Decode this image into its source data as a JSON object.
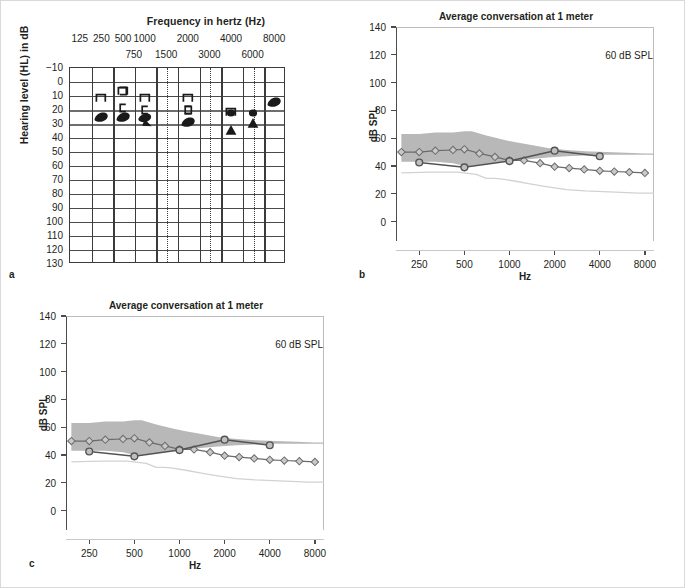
{
  "figure": {
    "panels": [
      {
        "letter": "a",
        "kind": "audiogram"
      },
      {
        "letter": "b",
        "kind": "spl"
      },
      {
        "letter": "c",
        "kind": "spl"
      }
    ]
  },
  "audiogram": {
    "x_axis_title": "Frequency in hertz (Hz)",
    "y_axis_title": "Hearing level (HL) in dB",
    "octave_ticks": [
      "125",
      "250",
      "500",
      "1000",
      "2000",
      "4000",
      "8000"
    ],
    "interoctave_ticks": [
      "750",
      "1500",
      "3000",
      "6000"
    ],
    "y_ticks": [
      "−10",
      "0",
      "10",
      "20",
      "30",
      "40",
      "50",
      "60",
      "70",
      "80",
      "90",
      "100",
      "110",
      "120",
      "130"
    ],
    "y_min": -10,
    "y_max": 130,
    "x_positions_hz": [
      125,
      250,
      500,
      750,
      1000,
      1500,
      2000,
      3000,
      4000,
      6000,
      8000
    ],
    "symbols": [
      {
        "name": "masked-bone-right-250",
        "glyph": "bracket-right",
        "hz": 250,
        "db": 12
      },
      {
        "name": "masked-bone-left-500",
        "glyph": "bracket-left",
        "hz": 500,
        "db": 19
      },
      {
        "name": "masked-bone-right-500",
        "glyph": "bracket-right",
        "hz": 500,
        "db": 7
      },
      {
        "name": "masked-bone-left-500b",
        "glyph": "bracket-left2",
        "hz": 500,
        "db": 7
      },
      {
        "name": "masked-bone-right-1000",
        "glyph": "bracket-right",
        "hz": 1000,
        "db": 12
      },
      {
        "name": "masked-bone-left-1000",
        "glyph": "bracket-left",
        "hz": 1000,
        "db": 21
      },
      {
        "name": "masked-bone-right-2000",
        "glyph": "bracket-right",
        "hz": 2000,
        "db": 12
      },
      {
        "name": "masked-bone-left-2000",
        "glyph": "bracket-left",
        "hz": 2000,
        "db": 21
      },
      {
        "name": "masked-bone-right-2000b",
        "glyph": "bracket-left2",
        "hz": 2000,
        "db": 21
      },
      {
        "name": "masked-bone-right-4000",
        "glyph": "bracket-right",
        "hz": 4000,
        "db": 22
      },
      {
        "name": "air-left-250",
        "glyph": "blob",
        "hz": 250,
        "db": 26
      },
      {
        "name": "air-left-500",
        "glyph": "blob",
        "hz": 500,
        "db": 26
      },
      {
        "name": "air-left-1000",
        "glyph": "blob-tri",
        "hz": 1000,
        "db": 28
      },
      {
        "name": "air-left-2000",
        "glyph": "blob",
        "hz": 2000,
        "db": 29
      },
      {
        "name": "air-left-4000",
        "glyph": "dot",
        "hz": 4000,
        "db": 23
      },
      {
        "name": "air-left-4000b",
        "glyph": "triangle",
        "hz": 4000,
        "db": 35
      },
      {
        "name": "air-left-6000",
        "glyph": "dot",
        "hz": 6000,
        "db": 23
      },
      {
        "name": "air-left-6000b",
        "glyph": "triangle",
        "hz": 6000,
        "db": 30
      },
      {
        "name": "air-left-8000",
        "glyph": "blob",
        "hz": 8000,
        "db": 15
      }
    ]
  },
  "spl_chart": {
    "title": "Average conversation at 1 meter",
    "note": "60 dB SPL",
    "y_title": "dB SPL",
    "x_title": "Hz",
    "y_ticks": [
      0,
      20,
      40,
      60,
      80,
      100,
      120,
      140
    ],
    "x_ticks": [
      250,
      500,
      1000,
      2000,
      4000,
      8000
    ],
    "y_min": -14,
    "y_max": 140,
    "x_min_hz": 175,
    "x_max_hz": 9200,
    "colors": {
      "banana_fill": "#b8b8b8",
      "aided_line": "#545454",
      "unaided_line": "#6b6b6b",
      "threshold_line": "#d2d2d2"
    }
  },
  "chart_data": [
    {
      "type": "line",
      "panel": "b",
      "title": "Average conversation at 1 meter",
      "xlabel": "Hz",
      "ylabel": "dB SPL",
      "annotation": "60 dB SPL",
      "xscale": "log",
      "xlim": [
        175,
        9200
      ],
      "ylim": [
        -14,
        140
      ],
      "yticks": [
        0,
        20,
        40,
        60,
        80,
        100,
        120,
        140
      ],
      "xticks": [
        250,
        500,
        1000,
        2000,
        4000,
        8000
      ],
      "grid": false,
      "legend": "none",
      "series": [
        {
          "name": "speech-banana-upper",
          "kind": "band-upper",
          "x": [
            190,
            250,
            320,
            420,
            500,
            560,
            700,
            900,
            1100,
            1400,
            1800,
            2400,
            3200,
            4400,
            6000,
            8000,
            9200
          ],
          "y": [
            63,
            63,
            64,
            64,
            65,
            65,
            62,
            59,
            57,
            55,
            53,
            51.5,
            50.5,
            50,
            49.5,
            49,
            49
          ]
        },
        {
          "name": "speech-banana-lower",
          "kind": "band-lower",
          "x": [
            190,
            250,
            320,
            420,
            500,
            560,
            700,
            900,
            1100,
            1400,
            1800,
            2400,
            3200,
            4400,
            6000,
            8000,
            9200
          ],
          "y": [
            43,
            43,
            43,
            42,
            40,
            40,
            41,
            43,
            44,
            45,
            46,
            47,
            47.5,
            48,
            48,
            48,
            48
          ]
        },
        {
          "name": "aided-response",
          "kind": "line-circle",
          "marker": "circle",
          "x": [
            250,
            500,
            1000,
            2000,
            4000
          ],
          "y": [
            42.5,
            39,
            43.5,
            51,
            47
          ]
        },
        {
          "name": "unaided-response",
          "kind": "line-diamond",
          "marker": "diamond",
          "x": [
            190,
            250,
            320,
            420,
            500,
            630,
            800,
            1000,
            1250,
            1600,
            2000,
            2500,
            3150,
            4000,
            5000,
            6300,
            8000
          ],
          "y": [
            50,
            50,
            51,
            51.5,
            52,
            49,
            46.5,
            44,
            44,
            42,
            39.5,
            38.5,
            37.5,
            36.5,
            36,
            35.5,
            35
          ]
        },
        {
          "name": "hearing-threshold",
          "kind": "line-thin",
          "x": [
            190,
            300,
            450,
            600,
            700,
            800,
            900,
            1100,
            1400,
            1800,
            2400,
            3200,
            4200,
            5600,
            7200,
            9200
          ],
          "y": [
            35,
            35.5,
            35.5,
            34,
            31,
            31,
            30.5,
            29,
            27,
            25,
            23,
            22,
            21.5,
            21,
            20.5,
            20.5
          ]
        }
      ]
    },
    {
      "type": "line",
      "panel": "c",
      "title": "Average conversation at 1 meter",
      "xlabel": "Hz",
      "ylabel": "dB SPL",
      "annotation": "60 dB SPL",
      "xscale": "log",
      "xlim": [
        175,
        9200
      ],
      "ylim": [
        -14,
        140
      ],
      "yticks": [
        0,
        20,
        40,
        60,
        80,
        100,
        120,
        140
      ],
      "xticks": [
        250,
        500,
        1000,
        2000,
        4000,
        8000
      ],
      "grid": false,
      "legend": "none",
      "series": [
        {
          "name": "speech-banana-upper",
          "kind": "band-upper",
          "x": [
            190,
            250,
            320,
            420,
            500,
            560,
            700,
            900,
            1100,
            1400,
            1800,
            2400,
            3200,
            4400,
            6000,
            8000,
            9200
          ],
          "y": [
            63,
            63,
            64,
            64,
            65,
            65,
            62,
            59,
            57,
            55,
            53,
            51.5,
            50.5,
            50,
            49.5,
            49,
            49
          ]
        },
        {
          "name": "speech-banana-lower",
          "kind": "band-lower",
          "x": [
            190,
            250,
            320,
            420,
            500,
            560,
            700,
            900,
            1100,
            1400,
            1800,
            2400,
            3200,
            4400,
            6000,
            8000,
            9200
          ],
          "y": [
            43,
            43,
            43,
            42,
            40,
            40,
            41,
            43,
            44,
            45,
            46,
            47,
            47.5,
            48,
            48,
            48,
            48
          ]
        },
        {
          "name": "aided-response",
          "kind": "line-circle",
          "marker": "circle",
          "x": [
            250,
            500,
            1000,
            2000,
            4000
          ],
          "y": [
            42.5,
            39,
            43.5,
            51,
            47
          ]
        },
        {
          "name": "unaided-response",
          "kind": "line-diamond",
          "marker": "diamond",
          "x": [
            190,
            250,
            320,
            420,
            500,
            630,
            800,
            1000,
            1250,
            1600,
            2000,
            2500,
            3150,
            4000,
            5000,
            6300,
            8000
          ],
          "y": [
            50,
            50,
            51,
            51.5,
            52,
            49,
            46.5,
            44,
            44,
            42,
            39.5,
            38.5,
            37.5,
            36.5,
            36,
            35.5,
            35
          ]
        },
        {
          "name": "hearing-threshold",
          "kind": "line-thin",
          "x": [
            190,
            300,
            450,
            600,
            700,
            800,
            900,
            1100,
            1400,
            1800,
            2400,
            3200,
            4200,
            5600,
            7200,
            9200
          ],
          "y": [
            35,
            35.5,
            35.5,
            34,
            31,
            31,
            30.5,
            29,
            27,
            25,
            23,
            22,
            21.5,
            21,
            20.5,
            20.5
          ]
        }
      ]
    }
  ]
}
